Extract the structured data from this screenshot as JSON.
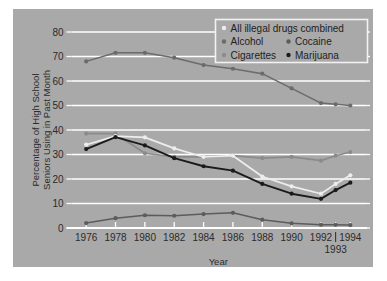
{
  "figure": {
    "background_color": "#a9a9a9",
    "page_color": "#ffffff",
    "gridline_color": "#ffffff"
  },
  "chart_data": {
    "type": "line",
    "title": "",
    "xlabel": "Year",
    "ylabel": "Percentage of High School Seniors Using in Past Month",
    "ylabel_line1": "Percentage of High School",
    "ylabel_line2": "Seniors Using in Past Month",
    "x": [
      1976,
      1978,
      1980,
      1982,
      1984,
      1986,
      1988,
      1990,
      1992,
      1993,
      1994
    ],
    "categories": [
      "1976",
      "1978",
      "1980",
      "1982",
      "1984",
      "1986",
      "1988",
      "1990",
      "1992",
      "1993",
      "1994"
    ],
    "xtick_labels": [
      "1976",
      "1978",
      "1980",
      "1982",
      "1984",
      "1986",
      "1988",
      "1990",
      "1992",
      "1994"
    ],
    "xtick_label_offset_below": "1993",
    "ytick_labels": [
      "0",
      "10",
      "20",
      "30",
      "40",
      "50",
      "60",
      "70",
      "80"
    ],
    "ylim": [
      0,
      80
    ],
    "xlim": [
      1975,
      1995
    ],
    "grid": true,
    "grid_axis": "y",
    "legend_position": "upper right",
    "series": [
      {
        "name": "All illegal drugs combined",
        "color": "#ededed",
        "values": [
          34.0,
          37.5,
          37.0,
          32.5,
          29.0,
          29.5,
          21.0,
          17.0,
          14.0,
          18.0,
          21.5
        ]
      },
      {
        "name": "Alcohol",
        "color": "#6b6b6b",
        "values": [
          68.0,
          71.5,
          71.5,
          69.5,
          66.5,
          65.0,
          63.0,
          57.0,
          51.0,
          50.5,
          50.0
        ]
      },
      {
        "name": "Cigarettes",
        "color": "#8b8b8b",
        "values": [
          38.5,
          38.5,
          30.5,
          29.0,
          29.0,
          29.5,
          28.5,
          29.0,
          27.5,
          29.5,
          31.0
        ]
      },
      {
        "name": "Cocaine",
        "color": "#5c5c5c",
        "values": [
          2.0,
          4.0,
          5.2,
          5.0,
          5.7,
          6.2,
          3.4,
          1.9,
          1.3,
          1.3,
          1.2
        ]
      },
      {
        "name": "Marijuana",
        "color": "#1b1b1b",
        "values": [
          32.2,
          37.1,
          33.7,
          28.5,
          25.2,
          23.4,
          18.0,
          14.0,
          11.9,
          15.5,
          18.5
        ]
      }
    ]
  },
  "legend": {
    "entries": [
      {
        "label": "All illegal drugs combined",
        "marker_color": "#ededed"
      },
      {
        "label": "Alcohol",
        "marker_color": "#6b6b6b"
      },
      {
        "label": "Cocaine",
        "marker_color": "#5c5c5c"
      },
      {
        "label": "Cigarettes",
        "marker_color": "#8b8b8b"
      },
      {
        "label": "Marijuana",
        "marker_color": "#1b1b1b"
      }
    ]
  }
}
